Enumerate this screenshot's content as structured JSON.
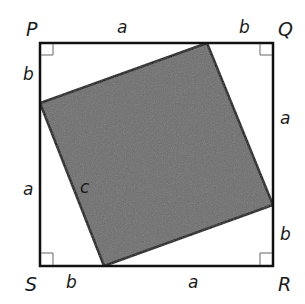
{
  "diagram": {
    "colors": {
      "outline": "#111111",
      "shaded_square": "#6e6e6e",
      "right_angle_mark": "#666666",
      "background": "#ffffff"
    },
    "vertices": {
      "P": "P",
      "Q": "Q",
      "R": "R",
      "S": "S"
    },
    "side_labels": {
      "top_a": "a",
      "top_b": "b",
      "left_b": "b",
      "left_a": "a",
      "right_a": "a",
      "right_b": "b",
      "bottom_b": "b",
      "bottom_a": "a",
      "hypotenuse_c": "c"
    }
  }
}
